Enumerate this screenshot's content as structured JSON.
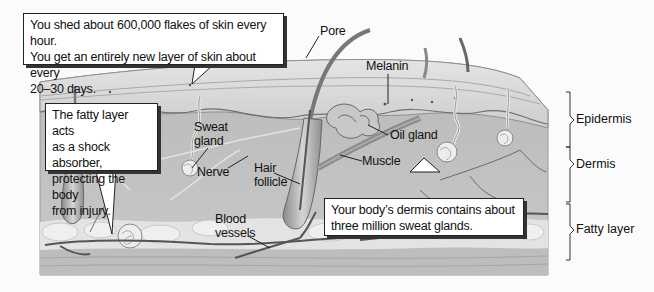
{
  "diagram": {
    "callouts": {
      "shedding": {
        "lines": [
          "You shed about 600,000 flakes of skin every hour.",
          "You get an entirely new layer of skin about every",
          "20–30 days."
        ]
      },
      "fatty_layer": {
        "lines": [
          "The fatty layer acts",
          "as a shock absorber,",
          "protecting the body",
          "from injury."
        ]
      },
      "dermis": {
        "lines": [
          "Your body’s dermis contains about",
          "three million sweat glands."
        ]
      }
    },
    "structure_labels": {
      "pore": "Pore",
      "melanin": "Melanin",
      "oil_gland": "Oil gland",
      "muscle": "Muscle",
      "sweat_gland": [
        "Sweat",
        "gland"
      ],
      "nerve": "Nerve",
      "hair_follicle": [
        "Hair",
        "follicle"
      ],
      "blood_vessels": [
        "Blood",
        "vessels"
      ]
    },
    "layers": [
      {
        "name": "Epidermis"
      },
      {
        "name": "Dermis"
      },
      {
        "name": "Fatty layer"
      }
    ],
    "colors": {
      "background": "#fbfbfb",
      "epidermis": "#cfcfcf",
      "dermis": "#c4c4c4",
      "fat": "#e6e6e6",
      "outline": "#222222"
    }
  }
}
